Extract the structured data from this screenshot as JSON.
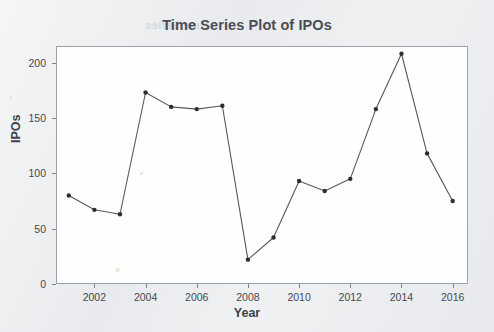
{
  "chart_data": {
    "type": "line",
    "title": "Time Series Plot of IPOs",
    "xlabel": "Year",
    "ylabel": "IPOs",
    "x": [
      2001,
      2002,
      2003,
      2004,
      2005,
      2006,
      2007,
      2008,
      2009,
      2010,
      2011,
      2012,
      2013,
      2014,
      2015,
      2016
    ],
    "values": [
      80,
      67,
      63,
      173,
      160,
      158,
      161,
      22,
      42,
      93,
      84,
      95,
      158,
      208,
      118,
      75
    ],
    "series": [
      {
        "name": "IPOs",
        "values": [
          80,
          67,
          63,
          173,
          160,
          158,
          161,
          22,
          42,
          93,
          84,
          95,
          158,
          208,
          118,
          75
        ]
      }
    ],
    "xlim": [
      2000.5,
      2016.6
    ],
    "ylim": [
      0,
      215
    ],
    "y_ticks": [
      0,
      50,
      100,
      150,
      200
    ],
    "y_tick_labels": [
      "0",
      "50",
      "100",
      "150",
      "200"
    ],
    "x_ticks": [
      2002,
      2004,
      2006,
      2008,
      2010,
      2012,
      2014,
      2016
    ],
    "x_tick_labels": [
      "2002",
      "2004",
      "2006",
      "2008",
      "2010",
      "2012",
      "2014",
      "2016"
    ],
    "grid": false,
    "legend": false,
    "marker": "filled-circle",
    "line_color": "#55585d",
    "marker_color": "#2b2d30",
    "plot_background": "#fefefe",
    "page_background": "#e8eaed"
  },
  "artifacts": {
    "bleed_text": "Time Series"
  }
}
